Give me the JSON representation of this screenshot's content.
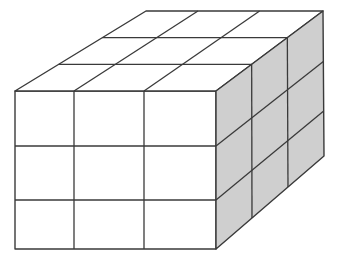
{
  "figure": {
    "grid": {
      "rows": 3,
      "cols": 3,
      "depth": 3
    },
    "colors": {
      "stroke": "#3a3a3a",
      "front": "#ffffff",
      "top": "#ffffff",
      "side": "#cfcfcf",
      "background": "#ffffff"
    }
  }
}
